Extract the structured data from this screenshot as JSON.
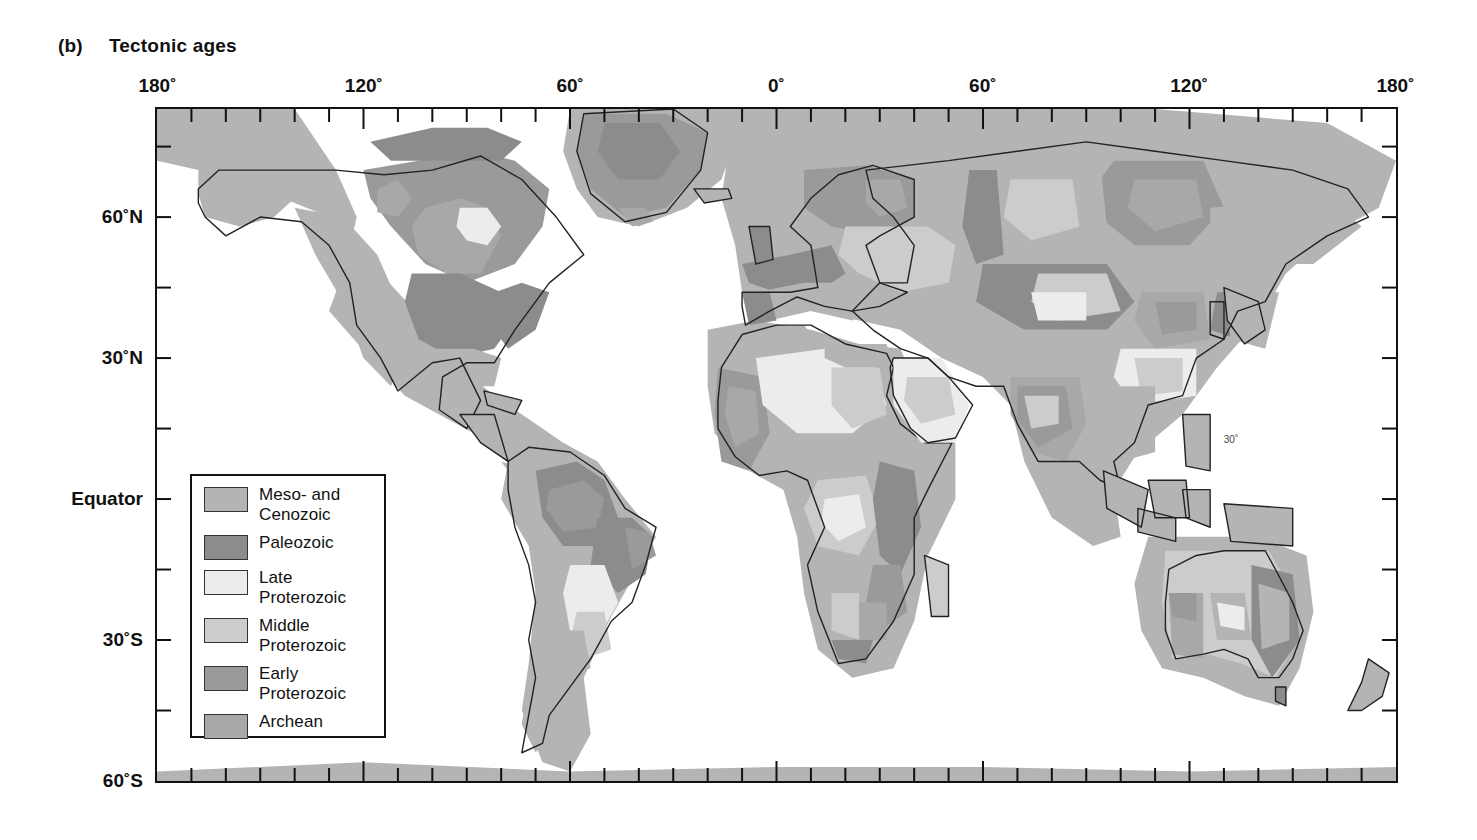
{
  "figure": {
    "panel_letter": "(b)",
    "title": "Tectonic ages"
  },
  "axes": {
    "x_labels": [
      {
        "text": "180˚",
        "deg": -180
      },
      {
        "text": "120˚",
        "deg": -120
      },
      {
        "text": "60˚",
        "deg": -60
      },
      {
        "text": "0˚",
        "deg": 0
      },
      {
        "text": "60˚",
        "deg": 60
      },
      {
        "text": "120˚",
        "deg": 120
      },
      {
        "text": "180˚",
        "deg": 180
      }
    ],
    "y_labels": [
      {
        "text": "60˚N",
        "deg": 60
      },
      {
        "text": "30˚N",
        "deg": 30
      },
      {
        "text": "Equator",
        "deg": 0
      },
      {
        "text": "30˚S",
        "deg": -30
      },
      {
        "text": "60˚S",
        "deg": -60
      }
    ],
    "x_range": [
      -180,
      180
    ],
    "y_range": [
      -60,
      83
    ],
    "x_tick_step": 10,
    "y_tick_step": 15,
    "x_label_step": 60,
    "y_label_step": 30
  },
  "legend": {
    "items": [
      {
        "label": "Meso- and\nCenozoic",
        "color": "#b4b4b4"
      },
      {
        "label": "Paleozoic",
        "color": "#8c8c8c"
      },
      {
        "label": "Late\nProterozoic",
        "color": "#ececec"
      },
      {
        "label": "Middle\nProterozoic",
        "color": "#cccccc"
      },
      {
        "label": "Early\nProterozoic",
        "color": "#9a9a9a"
      },
      {
        "label": "Archean",
        "color": "#a8a8a8"
      }
    ]
  },
  "map_annotations": [
    {
      "text": "30˚",
      "x": 1229,
      "y": 437
    }
  ],
  "chart_data": {
    "type": "map",
    "title": "Tectonic ages",
    "projection": "equirectangular",
    "xlabel": "Longitude",
    "ylabel": "Latitude",
    "xlim": [
      -180,
      180
    ],
    "ylim": [
      -60,
      83
    ],
    "grid": false,
    "legend_position": "inside-left",
    "categories": [
      "Meso- and Cenozoic",
      "Paleozoic",
      "Late Proterozoic",
      "Middle Proterozoic",
      "Early Proterozoic",
      "Archean"
    ],
    "category_colors": [
      "#b4b4b4",
      "#8c8c8c",
      "#ececec",
      "#cccccc",
      "#9a9a9a",
      "#a8a8a8"
    ]
  }
}
